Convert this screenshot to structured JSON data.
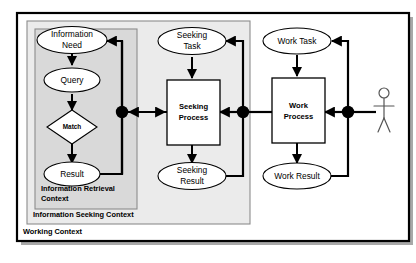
{
  "diagram": {
    "colors": {
      "outer_frame_border": "#000000",
      "outer_frame_fill": "#ffffff",
      "seeking_frame_fill": "#ebebeb",
      "retrieval_frame_fill": "#d9d9d9",
      "node_fill": "#ffffff",
      "node_stroke": "#000000",
      "connector_stroke": "#000000",
      "junction_fill": "#000000",
      "actor_stroke": "#555555",
      "page_background": "#ffffff"
    },
    "frames": [
      {
        "id": "working",
        "label": "Working Context"
      },
      {
        "id": "seeking",
        "label": "Information Seeking Context"
      },
      {
        "id": "retrieval",
        "label": "Information Retrieval Context"
      }
    ],
    "nodes": {
      "information_need": {
        "label_line1": "Information",
        "label_line2": "Need",
        "shape": "ellipse"
      },
      "query": {
        "label_line1": "Query",
        "shape": "ellipse"
      },
      "match": {
        "label_line1": "Match",
        "shape": "diamond"
      },
      "result": {
        "label_line1": "Result",
        "shape": "ellipse"
      },
      "seeking_task": {
        "label_line1": "Seeking",
        "label_line2": "Task",
        "shape": "ellipse"
      },
      "seeking_process": {
        "label_line1": "Seeking",
        "label_line2": "Process",
        "shape": "rectangle"
      },
      "seeking_result": {
        "label_line1": "Seeking",
        "label_line2": "Result",
        "shape": "ellipse"
      },
      "work_task": {
        "label_line1": "Work Task",
        "shape": "ellipse"
      },
      "work_process": {
        "label_line1": "Work",
        "label_line2": "Process",
        "shape": "rectangle"
      },
      "work_result": {
        "label_line1": "Work Result",
        "shape": "ellipse"
      },
      "actor": {
        "label_line1": "",
        "shape": "stick-figure"
      }
    },
    "junctions": [
      {
        "id": "junction-retrieval",
        "x": 122,
        "y": 112
      },
      {
        "id": "junction-seeking",
        "x": 243,
        "y": 112
      },
      {
        "id": "junction-work",
        "x": 348,
        "y": 112
      }
    ]
  }
}
